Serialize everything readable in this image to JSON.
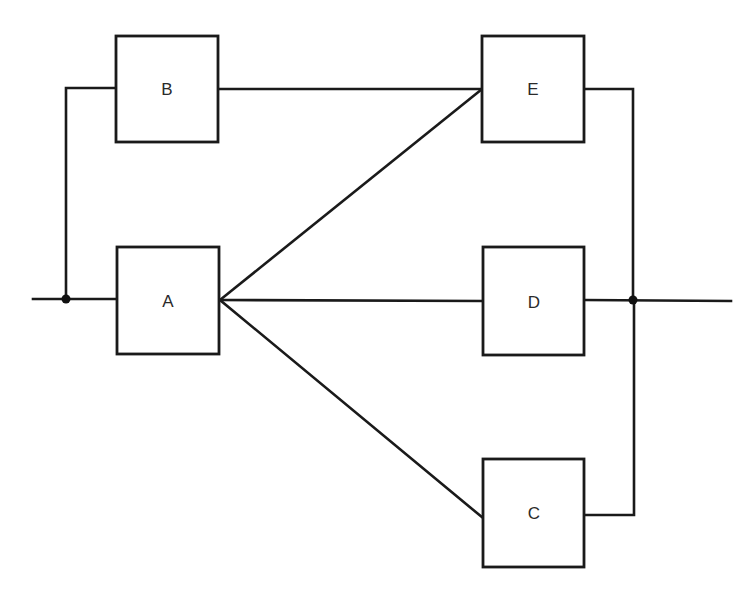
{
  "diagram": {
    "type": "reliability-block-diagram",
    "colors": {
      "line": "#1a1a1a",
      "label": "#2a2a2a",
      "background": "#ffffff"
    },
    "blocks": [
      {
        "id": "B",
        "label": "B",
        "x": 116,
        "y": 36,
        "w": 102,
        "h": 106
      },
      {
        "id": "A",
        "label": "A",
        "x": 117,
        "y": 247,
        "w": 102,
        "h": 107
      },
      {
        "id": "E",
        "label": "E",
        "x": 482,
        "y": 36,
        "w": 102,
        "h": 106
      },
      {
        "id": "D",
        "label": "D",
        "x": 483,
        "y": 247,
        "w": 101,
        "h": 108
      },
      {
        "id": "C",
        "label": "C",
        "x": 483,
        "y": 459,
        "w": 101,
        "h": 108
      }
    ],
    "junctions": [
      {
        "id": "input-node",
        "x": 66,
        "y": 299
      },
      {
        "id": "output-node",
        "x": 633,
        "y": 300
      }
    ],
    "connections": [
      {
        "from": "input",
        "to": "input-node"
      },
      {
        "from": "input-node",
        "to": "A"
      },
      {
        "from": "input-node",
        "to": "B"
      },
      {
        "from": "B",
        "to": "E"
      },
      {
        "from": "A",
        "to": "E"
      },
      {
        "from": "A",
        "to": "D"
      },
      {
        "from": "A",
        "to": "C"
      },
      {
        "from": "E",
        "to": "output-node"
      },
      {
        "from": "D",
        "to": "output-node"
      },
      {
        "from": "C",
        "to": "output-node"
      },
      {
        "from": "output-node",
        "to": "output"
      }
    ]
  }
}
